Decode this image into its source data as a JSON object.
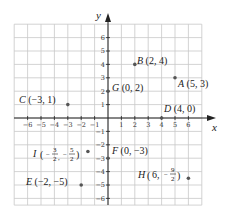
{
  "diagram": {
    "type": "coordinate-plane",
    "x_axis_label": "x",
    "y_axis_label": "y",
    "x_ticks": [
      "-6",
      "-5",
      "-4",
      "-3",
      "-2",
      "-1",
      "1",
      "2",
      "3",
      "4",
      "5",
      "6"
    ],
    "y_ticks": [
      "6",
      "5",
      "4",
      "3",
      "2",
      "1",
      "-1",
      "-2",
      "-3",
      "-4",
      "-5",
      "-6"
    ],
    "grid_range": {
      "x": [
        -7,
        7
      ],
      "y": [
        -6.5,
        7
      ]
    },
    "colors": {
      "grid": "#c8c8c8",
      "axis": "#222222",
      "point": "#555555",
      "text": "#222222"
    },
    "points": [
      {
        "name": "A",
        "coords": "(5, 3)",
        "x": 5,
        "y": 3
      },
      {
        "name": "B",
        "coords": "(2, 4)",
        "x": 2,
        "y": 4
      },
      {
        "name": "C",
        "coords": "(−3, 1)",
        "x": -3,
        "y": 1
      },
      {
        "name": "D",
        "coords": "(4, 0)",
        "x": 4,
        "y": 0
      },
      {
        "name": "E",
        "coords": "(−2, −5)",
        "x": -2,
        "y": -5
      },
      {
        "name": "F",
        "coords": "(0, −3)",
        "x": 0,
        "y": -3
      },
      {
        "name": "G",
        "coords": "(0, 2)",
        "x": 0,
        "y": 2
      },
      {
        "name": "H",
        "coords": "(6, −9/2)",
        "x": 6,
        "y": -4.5,
        "x_text": "6,",
        "y_num": "9",
        "y_den": "2"
      },
      {
        "name": "I",
        "coords": "(−3/2, −5/2)",
        "x": -1.5,
        "y": -2.5,
        "x_num": "3",
        "x_den": "2",
        "y_num": "5",
        "y_den": "2"
      }
    ]
  }
}
